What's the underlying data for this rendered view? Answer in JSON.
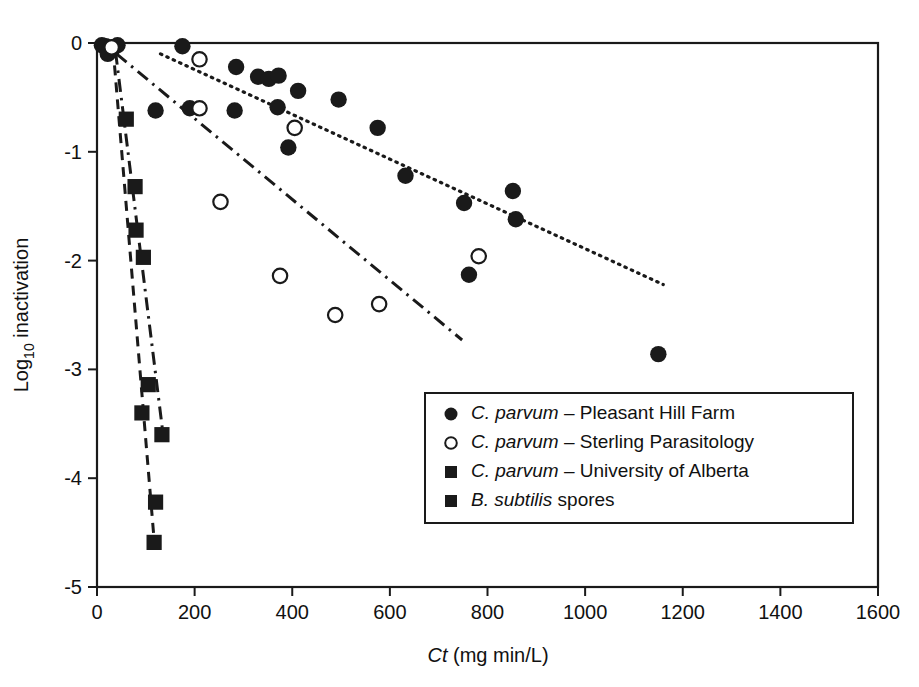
{
  "chart_data": {
    "type": "scatter",
    "title": "",
    "xlabel": "Ct (mg min/L)",
    "xlabel_italic_prefix": "Ct",
    "xlabel_rest": " (mg min/L)",
    "ylabel": "Log10 inactivation",
    "ylabel_base": "Log",
    "ylabel_sub": "10",
    "ylabel_tail": " inactivation",
    "xlim": [
      0,
      1600
    ],
    "ylim": [
      -5,
      0
    ],
    "xticks": [
      0,
      200,
      400,
      600,
      800,
      1000,
      1200,
      1400,
      1600
    ],
    "yticks": [
      0,
      -1,
      -2,
      -3,
      -4,
      -5
    ],
    "xtick_labels": [
      "0",
      "200",
      "400",
      "600",
      "800",
      "1000",
      "1200",
      "1400",
      "1600"
    ],
    "ytick_labels": [
      "0",
      "-1",
      "-2",
      "-3",
      "-4",
      "-5"
    ],
    "grid": false,
    "legend_position": "inside-lower-right",
    "series": [
      {
        "name": "C. parvum – Pleasant Hill Farm",
        "name_italic": "C. parvum",
        "name_rest": " – Pleasant Hill Farm",
        "marker": "filled-circle",
        "color": "#1a1a1a",
        "points": [
          [
            10,
            -0.02
          ],
          [
            18,
            -0.03
          ],
          [
            26,
            -0.05
          ],
          [
            34,
            -0.04
          ],
          [
            42,
            -0.02
          ],
          [
            22,
            -0.1
          ],
          [
            175,
            -0.03
          ],
          [
            120,
            -0.62
          ],
          [
            190,
            -0.6
          ],
          [
            285,
            -0.22
          ],
          [
            330,
            -0.31
          ],
          [
            352,
            -0.33
          ],
          [
            372,
            -0.3
          ],
          [
            412,
            -0.44
          ],
          [
            282,
            -0.62
          ],
          [
            370,
            -0.59
          ],
          [
            392,
            -0.96
          ],
          [
            495,
            -0.52
          ],
          [
            575,
            -0.78
          ],
          [
            632,
            -1.22
          ],
          [
            752,
            -1.47
          ],
          [
            852,
            -1.36
          ],
          [
            762,
            -2.13
          ],
          [
            858,
            -1.62
          ],
          [
            1150,
            -2.86
          ]
        ]
      },
      {
        "name": "C. parvum – Sterling Parasitology",
        "name_italic": "C. parvum",
        "name_rest": " – Sterling Parasitology",
        "marker": "open-circle",
        "color": "#1a1a1a",
        "points": [
          [
            30,
            -0.04
          ],
          [
            210,
            -0.15
          ],
          [
            210,
            -0.6
          ],
          [
            405,
            -0.78
          ],
          [
            253,
            -1.46
          ],
          [
            375,
            -2.14
          ],
          [
            488,
            -2.5
          ],
          [
            578,
            -2.4
          ],
          [
            782,
            -1.96
          ]
        ]
      },
      {
        "name": "C. parvum – University of Alberta",
        "name_italic": "C. parvum",
        "name_rest": " – University of Alberta",
        "marker": "filled-square",
        "color": "#1a1a1a",
        "points": [
          [
            60,
            -0.7
          ],
          [
            78,
            -1.32
          ],
          [
            80,
            -1.72
          ],
          [
            95,
            -1.97
          ],
          [
            105,
            -3.14
          ],
          [
            133,
            -3.6
          ]
        ]
      },
      {
        "name": "B. subtilis spores",
        "name_italic": "B. subtilis",
        "name_rest": " spores",
        "marker": "filled-square",
        "color": "#1a1a1a",
        "points": [
          [
            92,
            -3.4
          ],
          [
            120,
            -4.22
          ],
          [
            117,
            -4.59
          ]
        ]
      }
    ],
    "trend_lines": [
      {
        "name": "dotted-trend-pleasant-hill",
        "style": "dotted",
        "from": [
          130,
          -0.1
        ],
        "to": [
          1160,
          -2.22
        ]
      },
      {
        "name": "dashdot-trend-sterling",
        "style": "dash-dot",
        "from": [
          40,
          -0.1
        ],
        "to": [
          748,
          -2.73
        ]
      },
      {
        "name": "dashdot-trend-alberta",
        "style": "dash-dot",
        "from": [
          38,
          -0.08
        ],
        "to": [
          136,
          -3.62
        ]
      },
      {
        "name": "dashed-trend-subtilis",
        "style": "dashed",
        "from": [
          33,
          -0.05
        ],
        "to": [
          118,
          -4.62
        ]
      }
    ]
  },
  "legend": {
    "items": [
      {
        "marker": "filled-circle",
        "italic": "C. parvum",
        "rest": " – Pleasant Hill Farm"
      },
      {
        "marker": "open-circle",
        "italic": "C. parvum",
        "rest": " – Sterling Parasitology"
      },
      {
        "marker": "filled-square",
        "italic": "C. parvum",
        "rest": " – University of Alberta"
      },
      {
        "marker": "filled-square",
        "italic": "B. subtilis",
        "rest": " spores"
      }
    ]
  }
}
